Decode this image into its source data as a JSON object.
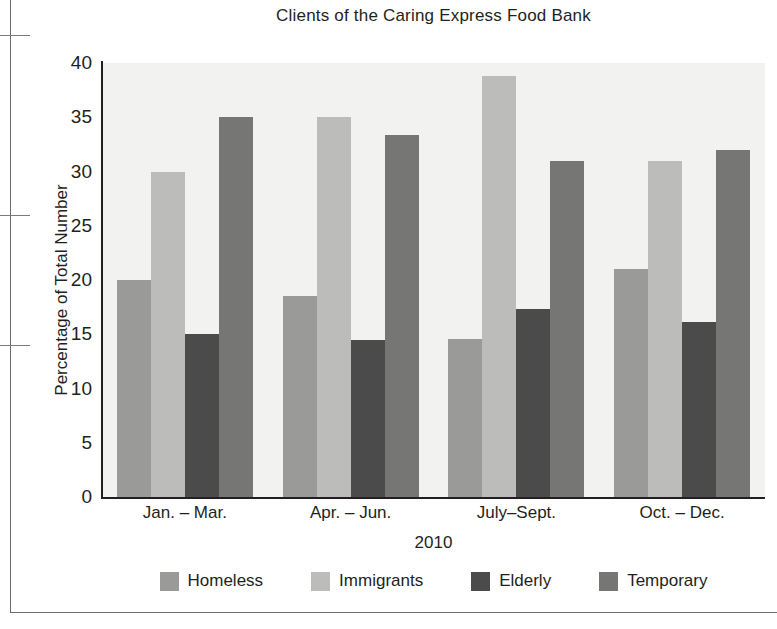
{
  "chart_data": {
    "type": "bar",
    "title": "Clients of the Caring Express Food Bank",
    "xlabel": "2010",
    "ylabel": "Percentage of Total Number",
    "categories": [
      "Jan. – Mar.",
      "Apr. – Jun.",
      "July–Sept.",
      "Oct. – Dec."
    ],
    "series": [
      {
        "name": "Homeless",
        "color": "#9a9a99",
        "values": [
          20.0,
          18.5,
          14.6,
          21.0
        ]
      },
      {
        "name": "Immigrants",
        "color": "#bcbcba",
        "values": [
          30.0,
          35.0,
          38.8,
          31.0
        ]
      },
      {
        "name": "Elderly",
        "color": "#4b4b4b",
        "values": [
          15.0,
          14.5,
          17.3,
          16.1
        ]
      },
      {
        "name": "Temporary",
        "color": "#767675",
        "values": [
          35.0,
          33.4,
          31.0,
          32.0
        ]
      }
    ],
    "ylim": [
      0,
      40
    ],
    "yticks": [
      0,
      5,
      10,
      15,
      20,
      25,
      30,
      35,
      40
    ],
    "ytick_labels": [
      "0",
      "5",
      "10",
      "15",
      "20",
      "25",
      "30",
      "35",
      "40"
    ],
    "grid": false,
    "legend_position": "bottom",
    "plot_background": "#f2f2f0",
    "axis_color": "#231f20"
  }
}
